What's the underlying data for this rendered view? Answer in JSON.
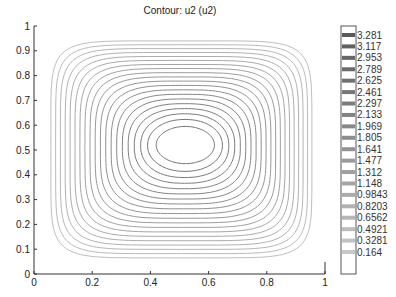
{
  "chart_data": {
    "type": "contour",
    "title": "Contour: u2 (u2)",
    "xlabel": "",
    "ylabel": "",
    "xlim": [
      0,
      1
    ],
    "ylim": [
      0,
      1
    ],
    "x_ticks": [
      "0",
      "0.2",
      "0.4",
      "0.6",
      "0.8",
      "1"
    ],
    "y_ticks": [
      "0",
      "0.1",
      "0.2",
      "0.3",
      "0.4",
      "0.5",
      "0.6",
      "0.7",
      "0.8",
      "0.9",
      "1"
    ],
    "grid": false,
    "levels": [
      3.281,
      3.117,
      2.953,
      2.789,
      2.625,
      2.461,
      2.297,
      2.133,
      1.969,
      1.805,
      1.641,
      1.477,
      1.312,
      1.148,
      0.9843,
      0.8203,
      0.6562,
      0.4921,
      0.3281,
      0.164
    ],
    "colorbar": {
      "position": "right",
      "labels": [
        "3.281",
        "3.117",
        "2.953",
        "2.789",
        "2.625",
        "2.461",
        "2.297",
        "2.133",
        "1.969",
        "1.805",
        "1.641",
        "1.477",
        "1.312",
        "1.148",
        "0.9843",
        "0.8203",
        "0.6562",
        "0.4921",
        "0.3281",
        "0.164"
      ]
    },
    "peak_location": [
      0.52,
      0.52
    ],
    "outer_contour_extent": {
      "x": [
        0.058,
        0.955
      ],
      "y": [
        0.065,
        0.94
      ]
    },
    "line_color": "#8a8a8a"
  }
}
